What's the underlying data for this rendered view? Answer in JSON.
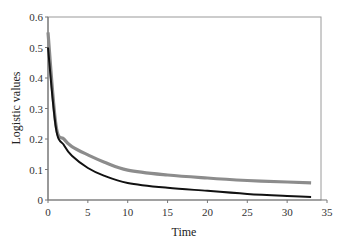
{
  "chart_data": {
    "type": "line",
    "title": "",
    "xlabel": "Time",
    "ylabel": "Logistic values",
    "xlim": [
      0,
      35
    ],
    "ylim": [
      0,
      0.6
    ],
    "x_ticks": [
      "0",
      "5",
      "10",
      "15",
      "20",
      "25",
      "30",
      "35"
    ],
    "y_ticks": [
      "0",
      "0.1",
      "0.2",
      "0.3",
      "0.4",
      "0.5",
      "0.6"
    ],
    "grid": false,
    "legend": null,
    "series": [
      {
        "name": "gray curve",
        "color": "#8c8c8c",
        "x": [
          0,
          1,
          2,
          3,
          5,
          7,
          10,
          15,
          20,
          25,
          30,
          33
        ],
        "values": [
          0.55,
          0.245,
          0.2,
          0.175,
          0.148,
          0.125,
          0.098,
          0.082,
          0.072,
          0.064,
          0.059,
          0.056
        ]
      },
      {
        "name": "black curve",
        "color": "#111111",
        "x": [
          0,
          1,
          2,
          3,
          5,
          7,
          10,
          15,
          20,
          25,
          30,
          33
        ],
        "values": [
          0.5,
          0.235,
          0.18,
          0.145,
          0.105,
          0.08,
          0.056,
          0.04,
          0.03,
          0.02,
          0.013,
          0.01
        ]
      }
    ]
  }
}
